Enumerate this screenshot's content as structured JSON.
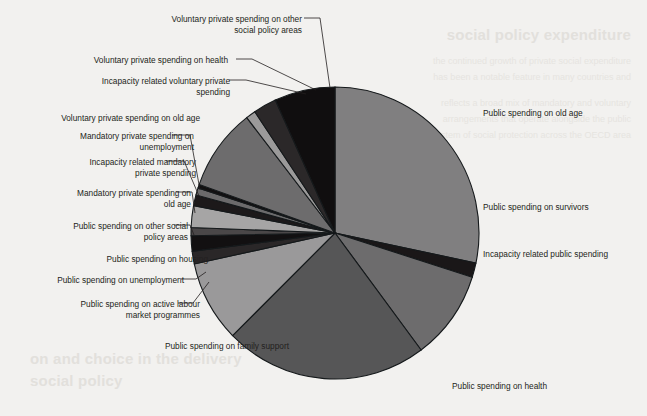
{
  "figure": {
    "background_color": "#f2f1ef",
    "page_background": "#ffffff"
  },
  "ghost_text": {
    "heading_right": "social policy expenditure",
    "heading_bottom_1": "on and choice in the delivery",
    "heading_bottom_2": "social policy",
    "body_lines": [
      "the continued growth of private social expenditure",
      "has been a notable feature in many countries and",
      "reflects a broad mix of mandatory and voluntary",
      "arrangements that operate alongside the public",
      "system of social protection across the OECD area"
    ]
  },
  "chart_data": {
    "type": "pie",
    "title": "",
    "subtitle": "",
    "xlabel": "",
    "ylabel": "",
    "legend_position": "callout-labels",
    "grid": false,
    "center": {
      "cx": 335,
      "cy": 233,
      "rx": 144,
      "ry": 146
    },
    "start_angle_deg": 0,
    "direction": "clockwise",
    "slices": [
      {
        "label": "Public spending on old age",
        "value": 28.3,
        "color": "#807f80",
        "label_side": "right",
        "label_x": 483,
        "label_y": 108,
        "leader": null
      },
      {
        "label": "Public spending on survivors",
        "value": 1.6,
        "color": "#1a1718",
        "label_side": "right",
        "label_x": 483,
        "label_y": 202,
        "leader": null
      },
      {
        "label": "Incapacity related public spending",
        "value": 9.9,
        "color": "#6d6c6d",
        "label_side": "right",
        "label_x": 483,
        "label_y": 249,
        "leader": null
      },
      {
        "label": "Public spending on health",
        "value": 22.8,
        "color": "#565657",
        "label_side": "right",
        "label_x": 452,
        "label_y": 381,
        "leader": null
      },
      {
        "label": "Public spending on family support",
        "value": 9.0,
        "color": "#9a999a",
        "label_side": "left-bottom",
        "label_x": 99,
        "label_y": 341,
        "leader": null
      },
      {
        "label": "Public spending on active labour\nmarket programmes",
        "value": 1.4,
        "color": "#2a2728",
        "label_side": "left",
        "label_x": 30,
        "label_y": 299,
        "leader": {
          "x1": 178,
          "y1": 303,
          "x2": 193,
          "y2": 303,
          "x3": 209,
          "y3": 282
        }
      },
      {
        "label": "Public spending on unemployment",
        "value": 1.7,
        "color": "#121011",
        "label_side": "left",
        "label_x": 14,
        "label_y": 275,
        "leader": {
          "x1": 181,
          "y1": 279,
          "x2": 196,
          "y2": 279,
          "x3": 206,
          "y3": 272
        }
      },
      {
        "label": "Public spending on housing",
        "value": 0.9,
        "color": "#4a4748",
        "label_side": "left",
        "label_x": 38,
        "label_y": 254,
        "leader": null
      },
      {
        "label": "Public spending on other social\npolicy areas",
        "value": 2.4,
        "color": "#a6a5a5",
        "label_side": "left",
        "label_x": 18,
        "label_y": 221,
        "leader": {
          "x1": 174,
          "y1": 225,
          "x2": 190,
          "y2": 225,
          "x3": 194,
          "y3": 235
        }
      },
      {
        "label": "Mandatory private spending on\nold age",
        "value": 1.2,
        "color": "#1c191a",
        "label_side": "left",
        "label_x": 21,
        "label_y": 188,
        "leader": {
          "x1": 176,
          "y1": 192,
          "x2": 192,
          "y2": 192,
          "x3": 195,
          "y3": 213
        }
      },
      {
        "label": "Incapacity related mandatory\nprivate spending",
        "value": 0.8,
        "color": "#6b6a6b",
        "label_side": "left",
        "label_x": 26,
        "label_y": 157,
        "leader": {
          "x1": 166,
          "y1": 161,
          "x2": 184,
          "y2": 161,
          "x3": 199,
          "y3": 196
        }
      },
      {
        "label": "Mandatory private spending on\nunemployment",
        "value": 0.4,
        "color": "#121011",
        "label_side": "left",
        "label_x": 24,
        "label_y": 131,
        "leader": {
          "x1": 172,
          "y1": 135,
          "x2": 190,
          "y2": 135,
          "x3": 200,
          "y3": 190
        }
      },
      {
        "label": "Voluntary private spending on old age",
        "value": 9.1,
        "color": "#6d6c6d",
        "label_side": "left",
        "label_x": 30,
        "label_y": 113,
        "leader": null
      },
      {
        "label": "Incapacity related voluntary private\nspending",
        "value": 1.1,
        "color": "#9b9a9a",
        "label_side": "left",
        "label_x": 60,
        "label_y": 76,
        "leader": {
          "x1": 229,
          "y1": 80,
          "x2": 246,
          "y2": 80,
          "x3": 306,
          "y3": 94
        }
      },
      {
        "label": "Voluntary private spending on health",
        "value": 2.6,
        "color": "#2b2829",
        "label_side": "left",
        "label_x": 58,
        "label_y": 55,
        "leader": {
          "x1": 236,
          "y1": 59,
          "x2": 252,
          "y2": 59,
          "x3": 316,
          "y3": 90
        }
      },
      {
        "label": "Voluntary private spending on other\nsocial policy areas",
        "value": 6.8,
        "color": "#100e0f",
        "label_side": "left",
        "label_x": 132,
        "label_y": 14,
        "leader": {
          "x1": 304,
          "y1": 18,
          "x2": 320,
          "y2": 18,
          "x3": 330,
          "y3": 88
        }
      }
    ],
    "total": 100.0
  }
}
